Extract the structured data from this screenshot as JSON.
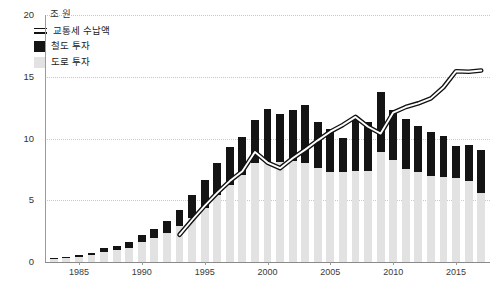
{
  "chart_data": {
    "type": "bar",
    "title": "",
    "subtitle": "",
    "unit_label": "조 원",
    "xlabel": "",
    "ylabel": "",
    "ylim": [
      0,
      20
    ],
    "yticks": [
      0,
      5,
      10,
      15,
      20
    ],
    "ytick_labels": [
      "0",
      "5",
      "10",
      "15",
      "20"
    ],
    "xticks": [
      1985,
      1990,
      1995,
      2000,
      2005,
      2010,
      2015
    ],
    "xtick_labels": [
      "1985",
      "1990",
      "1995",
      "2000",
      "2005",
      "2010",
      "2015"
    ],
    "xlim": [
      1982.3,
      2017.7
    ],
    "grid": "horizontal-dotted",
    "legend_position": "top-left",
    "stacked": true,
    "legend": [
      {
        "label": "교통세 수납액",
        "type": "line",
        "color": "#111111"
      },
      {
        "label": "철도 투자",
        "type": "bar",
        "color": "#141414"
      },
      {
        "label": "도로 투자",
        "type": "bar",
        "color": "#e2e2e2"
      }
    ],
    "categories": [
      1983,
      1984,
      1985,
      1986,
      1987,
      1988,
      1989,
      1990,
      1991,
      1992,
      1993,
      1994,
      1995,
      1996,
      1997,
      1998,
      1999,
      2000,
      2001,
      2002,
      2003,
      2004,
      2005,
      2006,
      2007,
      2008,
      2009,
      2010,
      2011,
      2012,
      2013,
      2014,
      2015,
      2016,
      2017
    ],
    "series": [
      {
        "name": "도로 투자",
        "color": "#e2e2e2",
        "values": [
          0.25,
          0.3,
          0.4,
          0.55,
          0.85,
          0.95,
          1.15,
          1.6,
          1.95,
          2.35,
          2.9,
          3.55,
          4.4,
          5.45,
          6.2,
          7.05,
          8.05,
          8.1,
          8.1,
          8.15,
          8.0,
          7.6,
          7.3,
          7.25,
          7.35,
          7.4,
          8.9,
          8.3,
          7.5,
          7.25,
          7.0,
          6.9,
          6.8,
          6.55,
          5.6
        ]
      },
      {
        "name": "철도 투자",
        "color": "#141414",
        "values": [
          0.1,
          0.12,
          0.15,
          0.2,
          0.3,
          0.35,
          0.45,
          0.6,
          0.75,
          0.95,
          1.35,
          1.85,
          2.25,
          2.6,
          3.15,
          3.1,
          3.45,
          4.3,
          3.85,
          4.2,
          4.75,
          3.75,
          3.5,
          2.8,
          4.4,
          3.9,
          4.9,
          4.0,
          4.05,
          3.8,
          3.55,
          3.3,
          2.6,
          2.9,
          3.5
        ]
      },
      {
        "name": "교통세 수납액",
        "color": "#111111",
        "type": "line",
        "start_year": 1993,
        "values": [
          null,
          null,
          null,
          null,
          null,
          null,
          null,
          null,
          null,
          null,
          2.2,
          3.4,
          4.55,
          5.6,
          6.55,
          7.35,
          8.9,
          8.05,
          7.6,
          8.4,
          9.1,
          9.85,
          10.55,
          11.1,
          11.75,
          10.95,
          10.4,
          12.1,
          12.55,
          12.85,
          13.25,
          14.15,
          15.45,
          15.4,
          15.5
        ]
      }
    ]
  }
}
